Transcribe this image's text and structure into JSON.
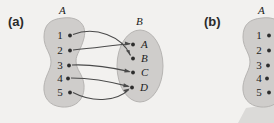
{
  "figure": {
    "background_color": "#f2f1ef",
    "blob_fill": "#cfcdcb",
    "arrow_color": "#4a4a4a",
    "dot_color": "#2d2d2d"
  },
  "panels": [
    {
      "id": "a",
      "label": "(a)",
      "domain": {
        "name": "A",
        "elements": [
          "1",
          "2",
          "3",
          "4",
          "5"
        ]
      },
      "codomain": {
        "name": "B",
        "elements": [
          "A",
          "B",
          "C",
          "D"
        ]
      },
      "mappings": [
        {
          "from": "1",
          "to": "B"
        },
        {
          "from": "2",
          "to": "A"
        },
        {
          "from": "3",
          "to": "C"
        },
        {
          "from": "4",
          "to": "D"
        },
        {
          "from": "5",
          "to": "D"
        }
      ]
    },
    {
      "id": "b",
      "label": "(b)",
      "domain": {
        "name": "A",
        "elements": [
          "1",
          "2",
          "3",
          "4",
          "5"
        ]
      },
      "codomain": {
        "name": "",
        "elements": []
      },
      "mappings": []
    }
  ]
}
